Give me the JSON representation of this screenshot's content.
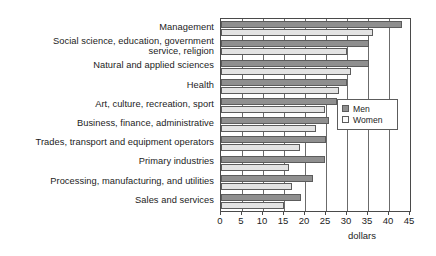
{
  "chart_data": {
    "type": "bar",
    "orientation": "horizontal",
    "title": "",
    "xlabel": "dollars",
    "ylabel": "",
    "xlim": [
      0,
      45
    ],
    "xticks": [
      0,
      5,
      10,
      15,
      20,
      25,
      30,
      35,
      40,
      45
    ],
    "grid": true,
    "legend_position": "right-middle",
    "categories": [
      "Management",
      "Social science, education, government\nservice, religion",
      "Natural and applied sciences",
      "Health",
      "Art, culture, recreation, sport",
      "Business, finance, administrative",
      "Trades, transport and equipment operators",
      "Primary industries",
      "Processing, manufacturing, and utilities",
      "Sales and services"
    ],
    "series": [
      {
        "name": "Men",
        "color": "#8f8f8f",
        "values": [
          43.0,
          35.3,
          35.3,
          30.0,
          27.5,
          25.8,
          25.0,
          24.7,
          22.0,
          19.0
        ]
      },
      {
        "name": "Women",
        "color": "#e3e3e3",
        "values": [
          36.2,
          30.0,
          31.0,
          28.0,
          24.7,
          22.7,
          18.7,
          16.3,
          17.0,
          15.0
        ]
      }
    ]
  },
  "legend": {
    "items": [
      {
        "label": "Men"
      },
      {
        "label": "Women"
      }
    ]
  },
  "axis": {
    "title": "dollars",
    "tick_labels": [
      "0",
      "5",
      "10",
      "15",
      "20",
      "25",
      "30",
      "35",
      "40",
      "45"
    ]
  }
}
